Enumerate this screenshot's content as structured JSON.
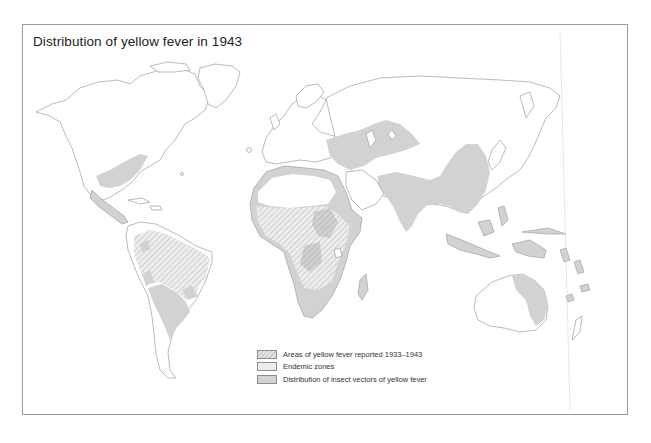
{
  "map": {
    "title": "Distribution of yellow fever in 1943",
    "legend": [
      {
        "key": "reported",
        "label": "Areas of yellow fever reported 1933–1943",
        "pattern": "hatched",
        "color": "#cfcfcf"
      },
      {
        "key": "endemic",
        "label": "Endemic zones",
        "pattern": "solid",
        "color": "#ececec"
      },
      {
        "key": "vectors",
        "label": "Distribution of insect vectors of yellow fever",
        "pattern": "solid",
        "color": "#d2d2d2"
      }
    ],
    "colors": {
      "land": "#ffffff",
      "coastline": "#a8a8a8",
      "vector_fill": "#d2d2d2",
      "reported_fill": "#c8c8c8",
      "frame": "#9a9a9a"
    },
    "regions_shaded": [
      "Southeastern United States",
      "Central America and Caribbean",
      "South America (Amazon basin, Brazil)",
      "Mediterranean and North Africa coast",
      "Sub-Saharan Africa",
      "Middle East and Central Asia",
      "India and Southeast Asia",
      "China",
      "Indonesia and New Guinea",
      "Northern and eastern Australia"
    ]
  }
}
